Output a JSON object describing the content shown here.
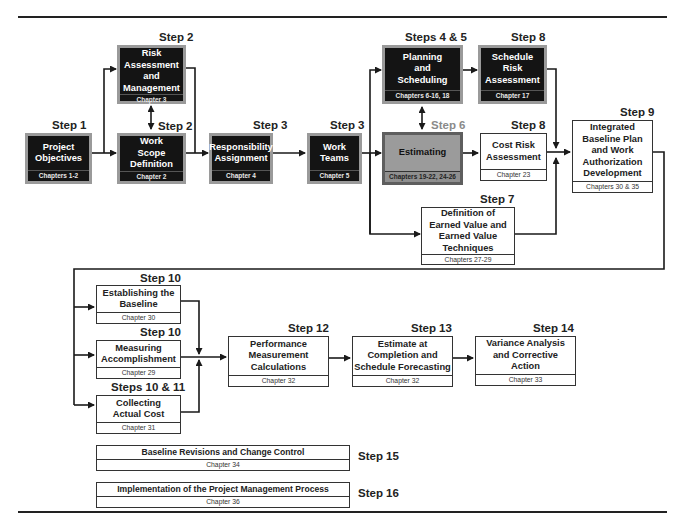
{
  "diagram": {
    "colors": {
      "dark_box_fill": "#141414",
      "dark_box_border": "#9a9a9a",
      "highlight_box_fill": "#9b9b9b",
      "light_box_fill": "#ffffff",
      "step6_label": "#8a8a8a",
      "line": "#1a1a1a"
    },
    "boxes": {
      "project_objectives": {
        "step": "Step 1",
        "title": "Project Objectives",
        "chapter": "Chapters 1-2"
      },
      "risk_assessment": {
        "step": "Step 2",
        "title": "Risk Assessment and Management",
        "chapter": "Chapter 3"
      },
      "work_scope": {
        "step": "Step 2",
        "title": "Work Scope Definition",
        "chapter": "Chapter 2"
      },
      "responsibility": {
        "step": "Step 3",
        "title": "Responsibility Assignment",
        "chapter": "Chapter 4"
      },
      "work_teams": {
        "step": "Step 3",
        "title": "Work Teams",
        "chapter": "Chapter 5"
      },
      "planning": {
        "step": "Steps 4 & 5",
        "title": "Planning and Scheduling",
        "chapter": "Chapters 6-16, 18"
      },
      "schedule_risk": {
        "step": "Step 8",
        "title": "Schedule Risk Assessment",
        "chapter": "Chapter 17"
      },
      "estimating": {
        "step": "Step 6",
        "title": "Estimating",
        "chapter": "Chapters 19-22, 24-26"
      },
      "cost_risk": {
        "step": "Step 8",
        "title": "Cost Risk Assessment",
        "chapter": "Chapter 23"
      },
      "integrated_baseline": {
        "step": "Step 9",
        "title": "Integrated Baseline Plan and Work Authorization Development",
        "chapter": "Chapters 30 & 35"
      },
      "earned_value": {
        "step": "Step 7",
        "title": "Definition of Earned Value and Earned Value Techniques",
        "chapter": "Chapters 27-29"
      },
      "establishing_baseline": {
        "step": "Step 10",
        "title": "Establishing the Baseline",
        "chapter": "Chapter 30"
      },
      "measuring": {
        "step": "Step 10",
        "title": "Measuring Accomplishment",
        "chapter": "Chapter 29"
      },
      "actual_cost": {
        "step": "Steps 10 & 11",
        "title": "Collecting Actual Cost",
        "chapter": "Chapter 31"
      },
      "performance": {
        "step": "Step 12",
        "title": "Performance Measurement Calculations",
        "chapter": "Chapter 32"
      },
      "eac": {
        "step": "Step 13",
        "title": "Estimate at Completion and Schedule Forecasting",
        "chapter": "Chapter 32"
      },
      "variance": {
        "step": "Step 14",
        "title": "Variance Analysis and Corrective Action",
        "chapter": "Chapter 33"
      },
      "baseline_revisions": {
        "step": "Step 15",
        "title": "Baseline Revisions and Change Control",
        "chapter": "Chapter 34"
      },
      "implementation": {
        "step": "Step 16",
        "title": "Implementation of the Project Management Process",
        "chapter": "Chapter 36"
      }
    }
  }
}
